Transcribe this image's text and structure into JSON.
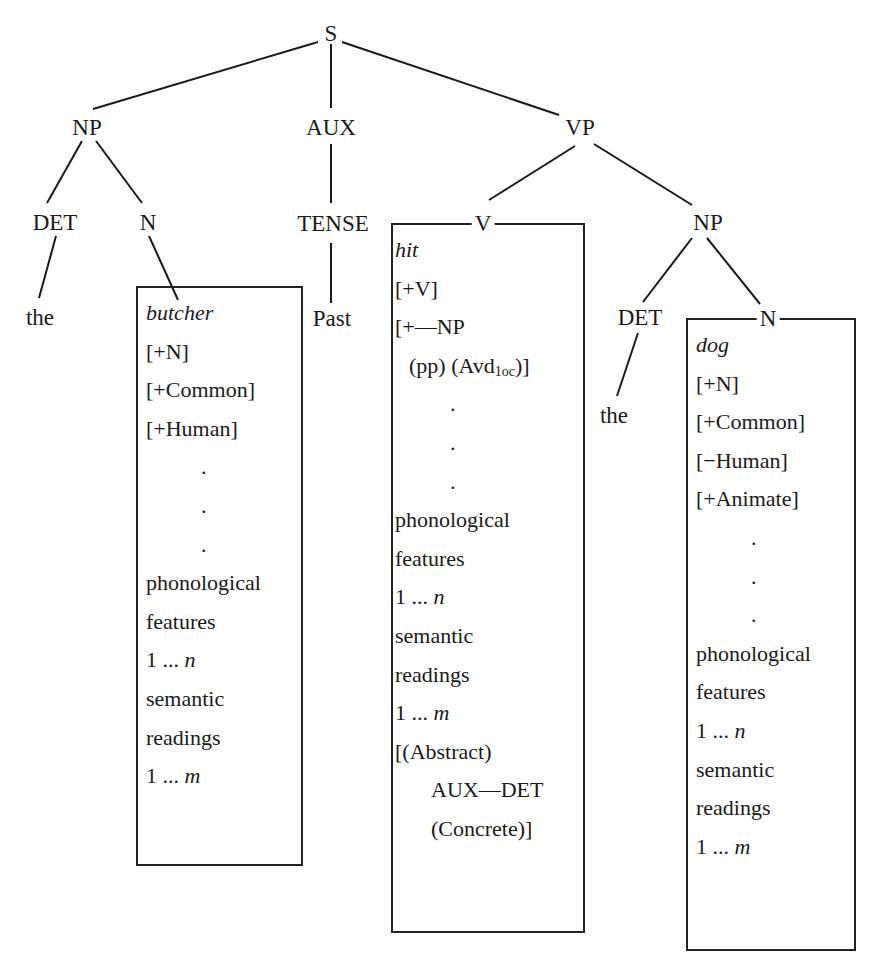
{
  "diagram": {
    "type": "syntactic-tree",
    "nodes": {
      "s": "S",
      "np_subject": "NP",
      "aux": "AUX",
      "vp": "VP",
      "det_subject": "DET",
      "n_subject": "N",
      "tense": "TENSE",
      "v": "V",
      "np_object": "NP",
      "det_object": "DET",
      "n_object": "N"
    },
    "leaves": {
      "the_subject": "the",
      "past": "Past",
      "the_object": "the"
    },
    "lexical_entries": {
      "butcher": {
        "word": "butcher",
        "features": [
          "[+N]",
          "[+Common]",
          "[+Human]"
        ],
        "ellipsis": [
          ".",
          ".",
          "."
        ],
        "phon_1": "phonological",
        "phon_2": "features",
        "phon_range_prefix": "1 ... ",
        "phon_range_var": "n",
        "sem_1": "semantic",
        "sem_2": "readings",
        "sem_range_prefix": "1 ... ",
        "sem_range_var": "m"
      },
      "hit": {
        "word": "hit",
        "features": [
          "[+V]",
          "[+—NP"
        ],
        "subcat_cont_prefix": "(pp) (Avd",
        "subcat_cont_sub": "1oc",
        "subcat_cont_suffix": ")]",
        "ellipsis": [
          ".",
          ".",
          "."
        ],
        "phon_1": "phonological",
        "phon_2": "features",
        "phon_range_prefix": "1 ... ",
        "phon_range_var": "n",
        "sem_1": "semantic",
        "sem_2": "readings",
        "sem_range_prefix": "1 ... ",
        "sem_range_var": "m",
        "selection_1": "[(Abstract)",
        "selection_2": "AUX—DET",
        "selection_3": "(Concrete)]"
      },
      "dog": {
        "word": "dog",
        "features": [
          "[+N]",
          "[+Common]",
          "[−Human]",
          "[+Animate]"
        ],
        "ellipsis": [
          ".",
          ".",
          "."
        ],
        "phon_1": "phonological",
        "phon_2": "features",
        "phon_range_prefix": "1 ... ",
        "phon_range_var": "n",
        "sem_1": "semantic",
        "sem_2": "readings",
        "sem_range_prefix": "1 ... ",
        "sem_range_var": "m"
      }
    }
  }
}
